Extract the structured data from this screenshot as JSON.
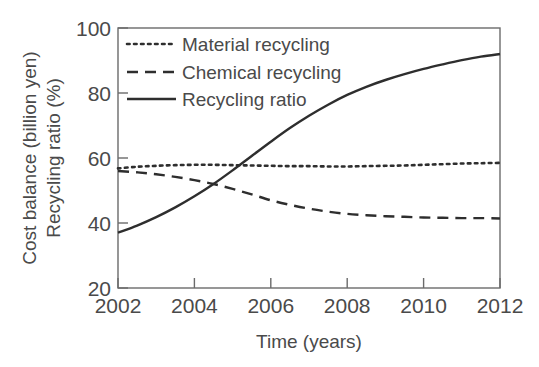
{
  "chart_data": {
    "type": "line",
    "title": "",
    "xlabel": "Time (years)",
    "ylabel": "Cost balance (billion yen)\nRecycling ratio (%)",
    "ylabel_line1": "Cost balance (billion yen)",
    "ylabel_line2": "Recycling ratio (%)",
    "xlim": [
      2002,
      2012
    ],
    "ylim": [
      20,
      100
    ],
    "xticks": [
      2002,
      2004,
      2006,
      2008,
      2010,
      2012
    ],
    "yticks": [
      20,
      40,
      60,
      80,
      100
    ],
    "xtick_labels": [
      "2002",
      "2004",
      "2006",
      "2008",
      "2010",
      "2012"
    ],
    "ytick_labels": [
      "20",
      "40",
      "60",
      "80",
      "100"
    ],
    "grid": false,
    "legend_position": "upper left",
    "x": [
      2002,
      2002.5,
      2003,
      2003.5,
      2004,
      2004.5,
      2005,
      2005.5,
      2006,
      2006.5,
      2007,
      2007.5,
      2008,
      2008.5,
      2009,
      2009.5,
      2010,
      2010.5,
      2011,
      2011.5,
      2012
    ],
    "series": [
      {
        "name": "Material recycling",
        "style": "dotted",
        "color": "#2e2e2e",
        "values": [
          56.8,
          57.3,
          57.6,
          57.8,
          57.9,
          57.9,
          57.8,
          57.7,
          57.6,
          57.5,
          57.5,
          57.4,
          57.4,
          57.5,
          57.6,
          57.7,
          57.9,
          58.1,
          58.3,
          58.4,
          58.5
        ]
      },
      {
        "name": "Chemical recycling",
        "style": "dashed",
        "color": "#2e2e2e",
        "values": [
          56.0,
          55.6,
          55.0,
          54.2,
          53.2,
          52.0,
          50.5,
          48.8,
          47.0,
          45.6,
          44.4,
          43.5,
          42.8,
          42.4,
          42.1,
          41.9,
          41.7,
          41.6,
          41.5,
          41.5,
          41.4
        ]
      },
      {
        "name": "Recycling ratio",
        "style": "solid",
        "color": "#2e2e2e",
        "values": [
          37.0,
          39.2,
          41.8,
          44.8,
          48.2,
          52.0,
          56.2,
          60.6,
          65.0,
          69.2,
          73.0,
          76.4,
          79.4,
          81.9,
          84.0,
          85.8,
          87.4,
          88.8,
          90.1,
          91.2,
          92.0
        ]
      }
    ],
    "legend_entries": [
      "Material recycling",
      "Chemical recycling",
      "Recycling ratio"
    ],
    "axis_color": "#6b6b6b",
    "text_color": "#4a4a4a",
    "background": "#ffffff"
  }
}
